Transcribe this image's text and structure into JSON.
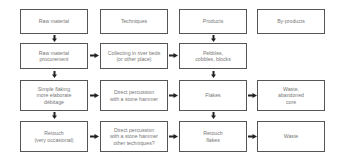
{
  "headers": [
    "Raw material",
    "Techniques",
    "Products",
    "By-products"
  ],
  "rows": [
    {
      "stage": "Raw material\nprocurement",
      "technique": "Collecting in river beds\n(or other place)",
      "product": "Pebbles,\ncobbles, blocks",
      "byproduct": ""
    },
    {
      "stage": "Simple flaking\nmore elaborate\ndébitage",
      "technique": "Direct percussion\nwith a stone hammer",
      "product": "Flakes",
      "byproduct": "Waste,\nabandoned\ncore"
    },
    {
      "stage": "Retouch\n(very occasional)",
      "technique": "Direct percussion\nwith a stone hammer\nother techniques?",
      "product": "Retouch\nflakes",
      "byproduct": "Waste"
    }
  ]
}
